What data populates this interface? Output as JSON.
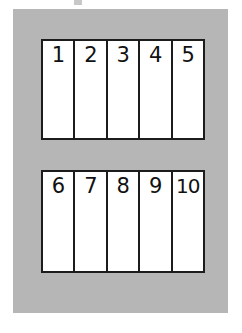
{
  "page": {
    "background_color": "#ffffff"
  },
  "panel": {
    "background_color": "#b6b6b6",
    "border_color": "#1c1c1c"
  },
  "strips": [
    {
      "name": "top-strip",
      "cells": [
        {
          "label": "1"
        },
        {
          "label": "2"
        },
        {
          "label": "3"
        },
        {
          "label": "4"
        },
        {
          "label": "5"
        }
      ]
    },
    {
      "name": "bottom-strip",
      "cells": [
        {
          "label": "6"
        },
        {
          "label": "7"
        },
        {
          "label": "8"
        },
        {
          "label": "9"
        },
        {
          "label": "10"
        }
      ]
    }
  ]
}
